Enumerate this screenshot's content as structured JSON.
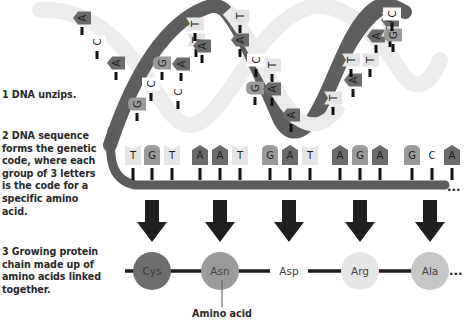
{
  "steps": [
    {
      "text": "1 DNA unzips."
    },
    {
      "text": "2 DNA sequence forms the genetic code, where each group of 3 letters is the code for a specific amino acid."
    },
    {
      "text": "3 Growing protein chain made up of amino acids linked together."
    }
  ],
  "helix": {
    "upper_bases": [
      "A",
      "C",
      "A",
      "G",
      "C",
      "G",
      "C",
      "A",
      "T",
      "T",
      "A",
      "T",
      "A",
      "C",
      "G",
      "T",
      "A",
      "A",
      "T",
      "A",
      "T",
      "T",
      "A",
      "T",
      "A",
      "G",
      "C"
    ]
  },
  "sequence": {
    "bases": [
      "T",
      "G",
      "T",
      "A",
      "A",
      "T",
      "G",
      "A",
      "T",
      "A",
      "G",
      "A",
      "G",
      "C",
      "A"
    ],
    "codons": [
      "TGT",
      "AAT",
      "GAT",
      "AGA",
      "GCA"
    ],
    "continuation": "..."
  },
  "amino_acids": [
    {
      "name": "Cys",
      "color": "#6e6e6e"
    },
    {
      "name": "Asn",
      "color": "#9a9a9a"
    },
    {
      "name": "Asp",
      "color": "#ffffff"
    },
    {
      "name": "Arg",
      "color": "#e6e6e6"
    },
    {
      "name": "Ala",
      "color": "#c6c6c6"
    }
  ],
  "chain_continuation": "...",
  "amino_acid_label": "Amino acid",
  "colors": {
    "dark_strand": "#5a5a5a",
    "light_strand": "#e8e8e8",
    "A": "#6a6a6a",
    "G": "#9a9a9a",
    "T": "#e4e4e4",
    "C": "#ffffff",
    "arrow": "#1f1f1f"
  }
}
